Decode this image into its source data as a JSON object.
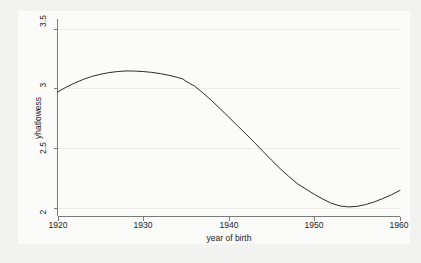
{
  "chart_data": {
    "type": "line",
    "title": "",
    "subtitle": "",
    "xlabel": "year of birth",
    "ylabel": "yhatlowess",
    "xlim": [
      1920,
      1960
    ],
    "ylim": [
      1.93,
      3.58
    ],
    "xticks": [
      "1920",
      "1930",
      "1940",
      "1950",
      "1960"
    ],
    "xtick_values": [
      1920,
      1930,
      1940,
      1950,
      1960
    ],
    "yticks": [
      "2",
      "2.5",
      "3",
      "3.5"
    ],
    "ytick_values": [
      2,
      2.5,
      3,
      3.5
    ],
    "grid": "horizontal-faint",
    "legend": "none",
    "series": [
      {
        "name": "yhatlowess",
        "color": "#2b2b2b",
        "x": [
          1920,
          1921,
          1922,
          1923,
          1924,
          1925,
          1926,
          1927,
          1928,
          1929,
          1930,
          1931,
          1932,
          1933,
          1934,
          1934.6,
          1935,
          1935.4,
          1936,
          1937,
          1938,
          1939,
          1940,
          1941,
          1942,
          1943,
          1944,
          1945,
          1946,
          1947,
          1948,
          1949,
          1950,
          1951,
          1952,
          1953,
          1954,
          1955,
          1956,
          1957,
          1958,
          1959,
          1960
        ],
        "values": [
          2.97,
          3.01,
          3.045,
          3.075,
          3.1,
          3.118,
          3.132,
          3.141,
          3.146,
          3.145,
          3.141,
          3.134,
          3.124,
          3.11,
          3.092,
          3.08,
          3.06,
          3.043,
          3.02,
          2.962,
          2.898,
          2.83,
          2.76,
          2.69,
          2.62,
          2.548,
          2.474,
          2.4,
          2.33,
          2.265,
          2.205,
          2.16,
          2.115,
          2.075,
          2.04,
          2.018,
          2.01,
          2.015,
          2.03,
          2.052,
          2.08,
          2.112,
          2.148
        ]
      }
    ]
  }
}
